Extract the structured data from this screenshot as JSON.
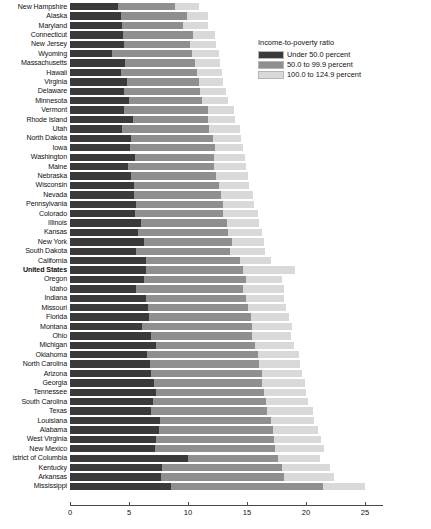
{
  "legend": {
    "title": "Income-to-poverty ratio",
    "items": [
      {
        "label": "Under 50.0 percent",
        "color": "#3a3a3a"
      },
      {
        "label": "50.0 to 99.9 percent",
        "color": "#8f8f8f"
      },
      {
        "label": "100.0 to 124.9 percent",
        "color": "#d9d9d9"
      }
    ]
  },
  "chart_data": {
    "type": "bar",
    "orientation": "horizontal",
    "stacked": true,
    "title": "",
    "xlabel": "",
    "ylabel": "",
    "xlim": [
      0,
      27
    ],
    "grid": false,
    "legend_position": "top-right",
    "xticks": [
      0,
      5,
      10,
      15,
      20,
      25
    ],
    "xtick_labels": [
      "0",
      "5",
      "10",
      "15",
      "20",
      "25"
    ],
    "series": [
      {
        "name": "Under 50.0 percent",
        "color": "#3a3a3a"
      },
      {
        "name": "50.0 to 99.9 percent",
        "color": "#8f8f8f"
      },
      {
        "name": "100.0 to 124.9 percent",
        "color": "#d9d9d9"
      }
    ],
    "categories": [
      "New Hampshire",
      "Alaska",
      "Maryland",
      "Connecticut",
      "New Jersey",
      "Wyoming",
      "Massachusetts",
      "Hawaii",
      "Virginia",
      "Delaware",
      "Minnesota",
      "Vermont",
      "Rhode Island",
      "Utah",
      "North Dakota",
      "Iowa",
      "Washington",
      "Maine",
      "Nebraska",
      "Wisconsin",
      "Nevada",
      "Pennsylvania",
      "Colorado",
      "Illinois",
      "Kansas",
      "New York",
      "South Dakota",
      "California",
      "United States",
      "Oregon",
      "Idaho",
      "Indiana",
      "Missouri",
      "Florida",
      "Montana",
      "Ohio",
      "Michigan",
      "Oklahoma",
      "North Carolina",
      "Arizona",
      "Georgia",
      "Tennessee",
      "South Carolina",
      "Texas",
      "Louisiana",
      "Alabama",
      "West Virginia",
      "New Mexico",
      "istrict of Columbia",
      "Kentucky",
      "Arkansas",
      "Mississippi"
    ],
    "highlight_category": "United States",
    "values": [
      [
        4.1,
        4.8,
        2.0
      ],
      [
        4.3,
        5.6,
        1.8
      ],
      [
        4.4,
        5.2,
        2.1
      ],
      [
        4.5,
        5.9,
        1.9
      ],
      [
        4.6,
        5.6,
        2.2
      ],
      [
        3.6,
        6.7,
        2.3
      ],
      [
        4.7,
        5.9,
        2.1
      ],
      [
        4.3,
        6.5,
        2.1
      ],
      [
        4.8,
        6.1,
        2.1
      ],
      [
        4.6,
        6.4,
        2.2
      ],
      [
        5.0,
        6.2,
        2.2
      ],
      [
        4.6,
        7.1,
        2.2
      ],
      [
        5.3,
        6.4,
        2.3
      ],
      [
        4.4,
        7.4,
        2.6
      ],
      [
        5.2,
        6.9,
        2.4
      ],
      [
        5.1,
        7.2,
        2.4
      ],
      [
        5.5,
        6.7,
        2.6
      ],
      [
        4.9,
        7.3,
        2.7
      ],
      [
        5.2,
        7.2,
        2.7
      ],
      [
        5.4,
        7.2,
        2.6
      ],
      [
        5.4,
        7.4,
        2.7
      ],
      [
        5.6,
        7.4,
        2.6
      ],
      [
        5.5,
        7.5,
        2.9
      ],
      [
        6.0,
        7.3,
        2.7
      ],
      [
        5.8,
        7.6,
        2.9
      ],
      [
        6.3,
        7.4,
        2.7
      ],
      [
        5.6,
        8.0,
        2.9
      ],
      [
        6.4,
        8.0,
        2.6
      ],
      [
        6.4,
        8.3,
        4.4
      ],
      [
        6.3,
        8.6,
        3.1
      ],
      [
        5.6,
        9.1,
        3.4
      ],
      [
        6.4,
        8.5,
        3.2
      ],
      [
        6.6,
        8.5,
        3.2
      ],
      [
        6.7,
        8.6,
        3.3
      ],
      [
        6.1,
        9.3,
        3.4
      ],
      [
        6.9,
        8.5,
        3.3
      ],
      [
        7.3,
        8.4,
        3.3
      ],
      [
        6.5,
        9.4,
        3.5
      ],
      [
        6.8,
        9.2,
        3.5
      ],
      [
        6.9,
        9.4,
        3.4
      ],
      [
        7.1,
        9.2,
        3.6
      ],
      [
        7.3,
        9.1,
        3.6
      ],
      [
        7.0,
        9.6,
        3.6
      ],
      [
        6.9,
        9.8,
        3.9
      ],
      [
        7.6,
        9.4,
        3.7
      ],
      [
        7.5,
        9.7,
        3.8
      ],
      [
        7.3,
        10.0,
        4.0
      ],
      [
        7.2,
        10.2,
        4.1
      ],
      [
        10.0,
        7.6,
        3.6
      ],
      [
        7.8,
        10.2,
        4.0
      ],
      [
        7.7,
        10.4,
        4.3
      ],
      [
        8.6,
        12.8,
        3.6
      ]
    ]
  }
}
